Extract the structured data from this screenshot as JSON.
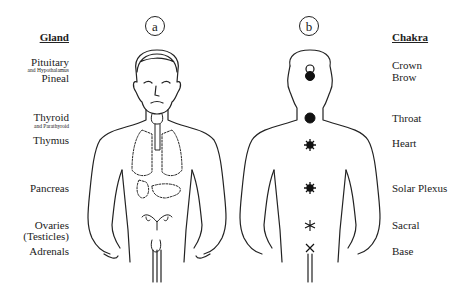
{
  "diagram": {
    "panel_a": {
      "label": "a"
    },
    "panel_b": {
      "label": "b"
    },
    "gland_column": {
      "header": "Gland",
      "items": [
        {
          "name": "Pituitary",
          "sub": "and Hypothalamus"
        },
        {
          "name": "Pineal"
        },
        {
          "name": "Thyroid",
          "sub": "and Parathyroid"
        },
        {
          "name": "Thymus"
        },
        {
          "name": "Pancreas"
        },
        {
          "name": "Ovaries"
        },
        {
          "name": "(Testicles)"
        },
        {
          "name": "Adrenals"
        }
      ]
    },
    "chakra_column": {
      "header": "Chakra",
      "items": [
        {
          "name": "Crown",
          "symbol": "open-circle"
        },
        {
          "name": "Brow",
          "symbol": "filled-circle"
        },
        {
          "name": "Throat",
          "symbol": "filled-burst"
        },
        {
          "name": "Heart",
          "symbol": "burst"
        },
        {
          "name": "Solar Plexus",
          "symbol": "burst"
        },
        {
          "name": "Sacral",
          "symbol": "asterisk"
        },
        {
          "name": "Base",
          "symbol": "cross"
        }
      ]
    }
  }
}
